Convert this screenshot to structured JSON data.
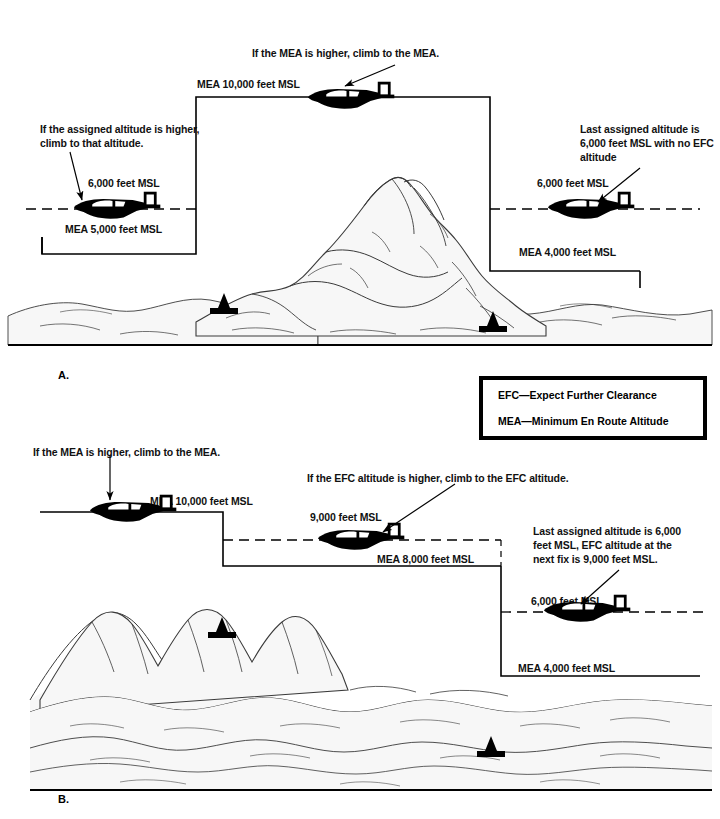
{
  "figure": {
    "panels": [
      {
        "id": "A",
        "label": "A.",
        "callouts": [
          {
            "name": "mea-higher-note",
            "text": "If the MEA is higher, climb to the MEA."
          },
          {
            "name": "assigned-higher-note",
            "text": "If the assigned altitude is higher,\nclimb to that altitude."
          },
          {
            "name": "last-assigned-note",
            "text": "Last assigned altitude is\n6,000 feet MSL with no EFC\naltitude"
          }
        ],
        "altitude_labels": [
          {
            "name": "mea-10000-label",
            "text": "MEA 10,000 feet MSL"
          },
          {
            "name": "aircraft-6000-left-label",
            "text": "6,000 feet MSL"
          },
          {
            "name": "mea-5000-label",
            "text": "MEA 5,000 feet MSL"
          },
          {
            "name": "aircraft-6000-right-label",
            "text": "6,000 feet MSL"
          },
          {
            "name": "mea-4000-label",
            "text": "MEA 4,000 feet MSL"
          }
        ]
      },
      {
        "id": "B",
        "label": "B.",
        "callouts": [
          {
            "name": "mea-higher-note",
            "text": "If the MEA is higher, climb to the MEA."
          },
          {
            "name": "efc-higher-note",
            "text": "If the EFC altitude is higher, climb to the EFC altitude."
          },
          {
            "name": "last-assigned-efc-note",
            "text": "Last assigned altitude is 6,000\nfeet MSL, EFC altitude at the\nnext fix is 9,000 feet MSL."
          }
        ],
        "altitude_labels": [
          {
            "name": "mea-10000-label",
            "text": "MEA 10,000 feet MSL"
          },
          {
            "name": "aircraft-9000-label",
            "text": "9,000 feet MSL"
          },
          {
            "name": "mea-8000-label",
            "text": "MEA 8,000 feet MSL"
          },
          {
            "name": "aircraft-6000-label",
            "text": "6,000 feet MSL"
          },
          {
            "name": "mea-4000-label",
            "text": "MEA 4,000 feet MSL"
          }
        ]
      }
    ],
    "legend": {
      "name": "abbreviation-legend",
      "lines": [
        "EFC—Expect Further Clearance",
        "MEA—Minimum En Route Altitude"
      ]
    },
    "colors": {
      "ink": "#000000",
      "terrain_fill": "#f7f7f7",
      "terrain_line": "#3a3a3a",
      "paper": "#ffffff"
    }
  }
}
